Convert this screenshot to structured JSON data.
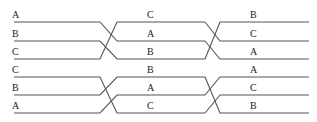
{
  "diagram": {
    "type": "permutation-wiring",
    "colors": {
      "line": "#555555",
      "text": "#222222",
      "background": "#ffffff"
    },
    "panels": [
      {
        "name": "top",
        "stages": [
          {
            "labels": [
              "A",
              "B",
              "C"
            ]
          },
          {
            "labels": [
              "C",
              "A",
              "B"
            ]
          },
          {
            "labels": [
              "B",
              "C",
              "A"
            ]
          }
        ]
      },
      {
        "name": "bottom",
        "stages": [
          {
            "labels": [
              "C",
              "B",
              "A"
            ]
          },
          {
            "labels": [
              "B",
              "A",
              "C"
            ]
          },
          {
            "labels": [
              "A",
              "C",
              "B"
            ]
          }
        ]
      }
    ]
  }
}
